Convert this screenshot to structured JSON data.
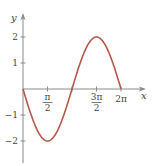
{
  "chart_data": {
    "type": "line",
    "title": "",
    "function": "y = -2 sin x",
    "xlabel": "x",
    "ylabel": "y",
    "xlim": [
      0,
      6.2832
    ],
    "ylim": [
      -2,
      2
    ],
    "x_ticks": [
      {
        "value": 1.5708,
        "num": "π",
        "den": "2"
      },
      {
        "value": 3.1416,
        "num": "",
        "den": ""
      },
      {
        "value": 4.7124,
        "num": "3π",
        "den": "2"
      },
      {
        "value": 6.2832,
        "label": "2π"
      }
    ],
    "y_ticks": [
      {
        "value": 2,
        "label": "2"
      },
      {
        "value": 1,
        "label": "1"
      },
      {
        "value": -1,
        "label": "−1"
      },
      {
        "value": -2,
        "label": "−2"
      }
    ],
    "series": [
      {
        "name": "y = -2 sin x",
        "color": "#b5574a",
        "x": [
          0,
          0.7854,
          1.5708,
          2.3562,
          3.1416,
          3.927,
          4.7124,
          5.4978,
          6.2832
        ],
        "y": [
          0,
          -1.414,
          -2,
          -1.414,
          0,
          1.414,
          2,
          1.414,
          0
        ]
      }
    ],
    "grid": false,
    "legend": "none"
  }
}
